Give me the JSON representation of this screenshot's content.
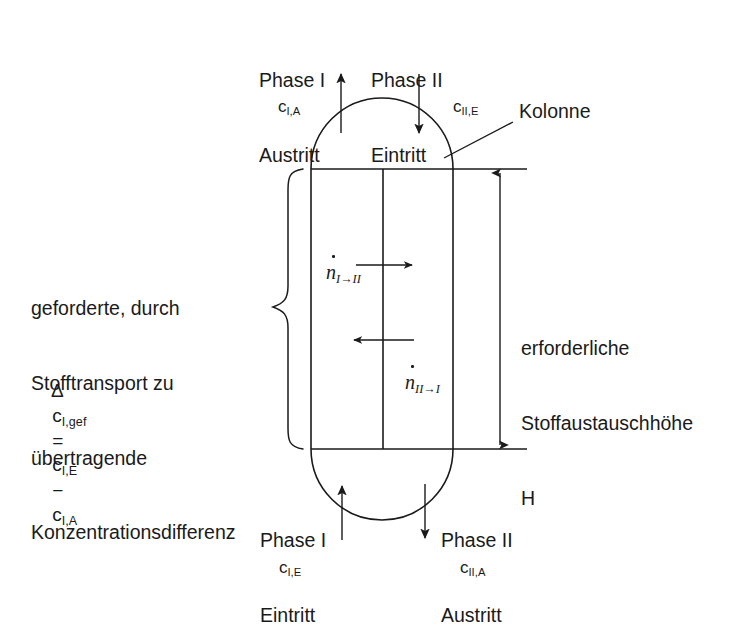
{
  "figure": {
    "background_color": "#ffffff",
    "line_color": "#1a1a1a"
  },
  "annotations": {
    "column_label": "Kolonne",
    "height_label_line1": "erforderliche",
    "height_label_line2": "Stoffaustauschhöhe",
    "height_label_line3": "H"
  },
  "left_text": {
    "line1": "geforderte, durch",
    "line2": "Stofftransport zu",
    "line3": "übertragende",
    "line4": "Konzentrationsdifferenz",
    "formula": {
      "delta": "Δ",
      "lhs_base": "c",
      "lhs_sub": "I,gef",
      "equals": "=",
      "term1_base": "c",
      "term1_sub": "I,E",
      "minus": "−",
      "term2_base": "c",
      "term2_sub": "I,A",
      "plain": "Δ c I,gef = c I,E − c I,A"
    }
  },
  "streams": {
    "top_left": {
      "name_line1": "Phase I",
      "name_line2": "Austritt",
      "conc_base": "c",
      "conc_sub": "I,A",
      "direction": "up"
    },
    "top_right": {
      "name_line1": "Phase II",
      "name_line2": "Eintritt",
      "conc_base": "c",
      "conc_sub": "II,E",
      "direction": "down"
    },
    "bottom_left": {
      "name_line1": "Phase I",
      "name_line2": "Eintritt",
      "conc_base": "c",
      "conc_sub": "I,E",
      "direction": "up"
    },
    "bottom_right": {
      "name_line1": "Phase II",
      "name_line2": "Austritt",
      "conc_base": "c",
      "conc_sub": "II,A",
      "direction": "down"
    }
  },
  "fluxes": {
    "upper": {
      "symbol": "n",
      "sub": "I→II",
      "direction": "right"
    },
    "lower": {
      "symbol": "n",
      "sub": "II→I",
      "direction": "left"
    }
  }
}
